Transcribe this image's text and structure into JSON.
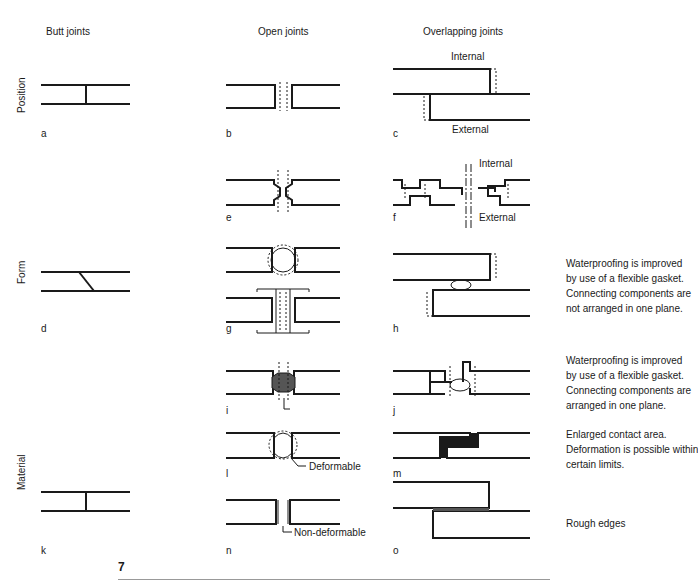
{
  "columns": {
    "butt": "Butt joints",
    "open": "Open joints",
    "overlapping": "Overlapping joints"
  },
  "rows": {
    "position": "Position",
    "form": "Form",
    "material": "Material"
  },
  "panel_labels": {
    "a": "a",
    "b": "b",
    "c": "c",
    "d": "d",
    "e": "e",
    "f": "f",
    "g": "g",
    "h": "h",
    "i": "i",
    "j": "j",
    "k": "k",
    "l": "l",
    "m": "m",
    "n": "n",
    "o": "o"
  },
  "annotations": {
    "c_internal": "Internal",
    "c_external": "External",
    "f_internal": "Internal",
    "f_external": "External",
    "l_deformable": "Deformable",
    "n_nondeformable": "Non-deformable"
  },
  "notes": {
    "h": [
      "Waterproofing is improved",
      "by use of a flexible gasket.",
      "Connecting components are",
      "not arranged in one plane."
    ],
    "j": [
      "Waterproofing is improved",
      "by use of a flexible gasket.",
      "Connecting components are",
      "arranged in one plane."
    ],
    "m": [
      "Enlarged contact area.",
      "Deformation is possible within",
      "certain limits."
    ],
    "o": [
      "Rough edges"
    ]
  },
  "figure_number": "7"
}
